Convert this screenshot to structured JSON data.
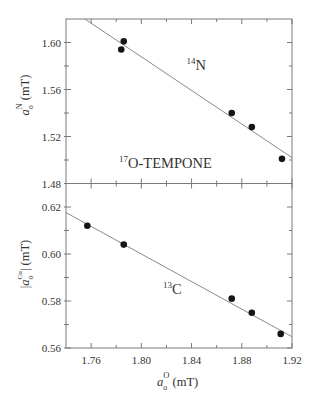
{
  "chart_data": {
    "type": "scatter",
    "title": "",
    "layout": "two vertically stacked panels sharing x axis",
    "grid": false,
    "legend": null,
    "xlabel": {
      "base": "a",
      "sub": "o",
      "sup": "O",
      "unit": "(mT)",
      "text": "a_o^O (mT)"
    },
    "xlim": [
      1.74,
      1.92
    ],
    "xticks": {
      "major": [
        1.76,
        1.8,
        1.84,
        1.88,
        1.92
      ],
      "major_labels": [
        "1.76",
        "1.80",
        "1.84",
        "1.88",
        "1.92"
      ],
      "minor": [
        1.78,
        1.82,
        1.86,
        1.9
      ]
    },
    "panels": [
      {
        "name": "top",
        "ylabel": {
          "base": "a",
          "sub": "o",
          "sup": "N",
          "unit": "(mT)",
          "text": "a_o^N (mT)",
          "abs": false
        },
        "ylim": [
          1.48,
          1.62
        ],
        "yticks": {
          "major": [
            1.48,
            1.52,
            1.56,
            1.6
          ],
          "major_labels": [
            "1.48",
            "1.52",
            "1.56",
            "1.60"
          ],
          "minor": [
            1.5,
            1.54,
            1.58
          ]
        },
        "points": [
          {
            "x": 1.784,
            "y": 1.594
          },
          {
            "x": 1.786,
            "y": 1.601
          },
          {
            "x": 1.872,
            "y": 1.54
          },
          {
            "x": 1.888,
            "y": 1.528
          },
          {
            "x": 1.912,
            "y": 1.501
          }
        ],
        "fit_line": {
          "x": [
            1.755,
            1.92
          ],
          "y": [
            1.62,
            1.502
          ]
        },
        "annotations": [
          {
            "sup": "14",
            "text": "N",
            "x": 1.836,
            "y": 1.5766
          },
          {
            "sup": "17",
            "text": "O-TEMPONE",
            "x": 1.7822,
            "y": 1.4932
          }
        ]
      },
      {
        "name": "bottom",
        "ylabel": {
          "base": "a",
          "sub": "o",
          "sup": "Cα",
          "unit": "(mT)",
          "text": "|a_o^Cα| (mT)",
          "abs": true
        },
        "ylim": [
          0.56,
          0.63
        ],
        "yticks": {
          "major": [
            0.56,
            0.58,
            0.6,
            0.62
          ],
          "major_labels": [
            "0.56",
            "0.58",
            "0.60",
            "0.62"
          ],
          "minor": [
            0.57,
            0.59,
            0.61
          ]
        },
        "points": [
          {
            "x": 1.757,
            "y": 0.612
          },
          {
            "x": 1.786,
            "y": 0.604
          },
          {
            "x": 1.872,
            "y": 0.581
          },
          {
            "x": 1.888,
            "y": 0.575
          },
          {
            "x": 1.911,
            "y": 0.566
          }
        ],
        "fit_line": {
          "x": [
            1.74,
            1.92
          ],
          "y": [
            0.6176,
            0.5648
          ]
        },
        "annotations": [
          {
            "sup": "13",
            "text": "C",
            "x": 1.8173,
            "y": 0.583
          }
        ]
      }
    ]
  },
  "colors": {
    "axis": "#7a7a7a",
    "marker": "#151515",
    "fit_line": "#8a8a8a",
    "text": "#333333",
    "background": "#ffffff"
  }
}
